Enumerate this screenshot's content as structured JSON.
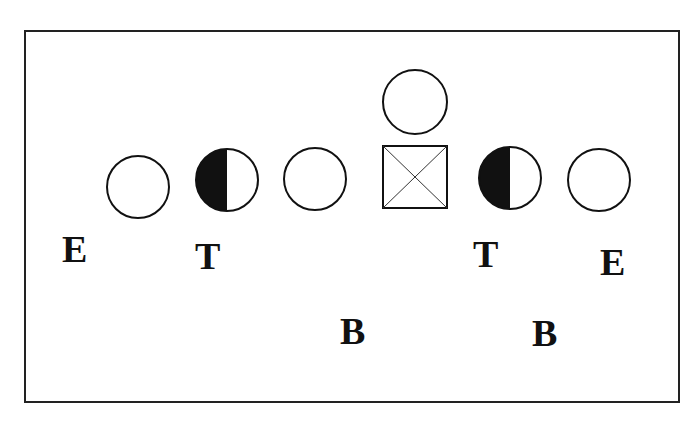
{
  "diagram": {
    "type": "football-formation",
    "players": [
      {
        "id": "left-end-player",
        "shape": "circle",
        "fill": "none",
        "cx": 138,
        "cy": 187
      },
      {
        "id": "left-tackle-player",
        "shape": "circle",
        "fill": "left-half",
        "cx": 227,
        "cy": 180
      },
      {
        "id": "left-guard-player",
        "shape": "circle",
        "fill": "none",
        "cx": 315,
        "cy": 179
      },
      {
        "id": "center-player",
        "shape": "square-x",
        "fill": "none",
        "cx": 413,
        "cy": 177
      },
      {
        "id": "quarterback-player",
        "shape": "circle",
        "fill": "none",
        "cx": 413,
        "cy": 102
      },
      {
        "id": "right-tackle-player",
        "shape": "circle",
        "fill": "left-half",
        "cx": 508,
        "cy": 178
      },
      {
        "id": "right-end-player",
        "shape": "circle",
        "fill": "none",
        "cx": 598,
        "cy": 180
      }
    ],
    "labels": [
      {
        "id": "left-end-label",
        "text": "E",
        "x": 62,
        "y": 230
      },
      {
        "id": "left-tackle-label",
        "text": "T",
        "x": 195,
        "y": 237
      },
      {
        "id": "left-back-label",
        "text": "B",
        "x": 340,
        "y": 312
      },
      {
        "id": "right-tackle-label",
        "text": "T",
        "x": 473,
        "y": 235
      },
      {
        "id": "right-end-label",
        "text": "E",
        "x": 600,
        "y": 243
      },
      {
        "id": "right-back-label",
        "text": "B",
        "x": 532,
        "y": 314
      }
    ],
    "colors": {
      "stroke": "#111111",
      "fill": "#111111",
      "background": "#ffffff"
    }
  }
}
